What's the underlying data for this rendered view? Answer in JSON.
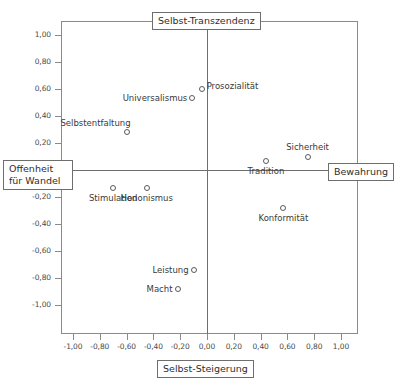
{
  "chart_data": {
    "type": "scatter",
    "title": "",
    "xlabel_left": "Offenheit für Wandel",
    "xlabel_right": "Bewahrung",
    "ylabel_top": "Selbst-Transzendenz",
    "ylabel_bottom": "Selbst-Steigerung",
    "xlim": [
      -1.1,
      1.1
    ],
    "ylim": [
      -1.1,
      1.1
    ],
    "grid": false,
    "legend": "none",
    "x_ticks": [
      "-1,00",
      "-0,80",
      "-0,60",
      "-0,40",
      "-0,20",
      "0,00",
      "0,20",
      "0,40",
      "0,60",
      "0,80",
      "1,00"
    ],
    "x_tick_values": [
      -1.0,
      -0.8,
      -0.6,
      -0.4,
      -0.2,
      0.0,
      0.2,
      0.4,
      0.6,
      0.8,
      1.0
    ],
    "y_ticks": [
      "1,00",
      "0,80",
      "0,60",
      "0,40",
      "0,20",
      "-0,20",
      "-0,40",
      "-0,60",
      "-0,80",
      "-1,00"
    ],
    "y_tick_values": [
      1.0,
      0.8,
      0.6,
      0.4,
      0.2,
      -0.2,
      -0.4,
      -0.6,
      -0.8,
      -1.0
    ],
    "points": [
      {
        "label": "Prosozialität",
        "x": -0.04,
        "y": 0.6,
        "label_pos": "right"
      },
      {
        "label": "Universalismus",
        "x": -0.11,
        "y": 0.53,
        "label_pos": "left"
      },
      {
        "label": "Selbstentfaltung",
        "x": -0.6,
        "y": 0.28,
        "label_pos": "above-left"
      },
      {
        "label": "Sicherheit",
        "x": 0.75,
        "y": 0.1,
        "label_pos": "above"
      },
      {
        "label": "Tradition",
        "x": 0.44,
        "y": 0.07,
        "label_pos": "below"
      },
      {
        "label": "Stimulation",
        "x": -0.7,
        "y": -0.13,
        "label_pos": "below"
      },
      {
        "label": "Hedonismus",
        "x": -0.45,
        "y": -0.13,
        "label_pos": "below"
      },
      {
        "label": "Konformität",
        "x": 0.57,
        "y": -0.28,
        "label_pos": "below"
      },
      {
        "label": "Leistung",
        "x": -0.1,
        "y": -0.74,
        "label_pos": "left"
      },
      {
        "label": "Macht",
        "x": -0.22,
        "y": -0.88,
        "label_pos": "left"
      }
    ]
  },
  "axis_labels": {
    "top": "Selbst-Transzendenz",
    "bottom": "Selbst-Steigerung",
    "left_line1": "Offenheit",
    "left_line2": "für Wandel",
    "right": "Bewahrung"
  }
}
